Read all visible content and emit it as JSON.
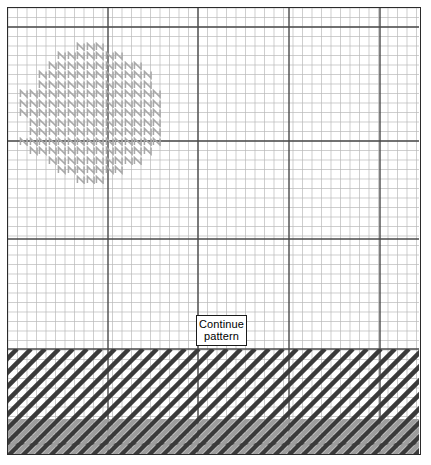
{
  "figure": {
    "kind": "graph-paper-diagram",
    "title_text": "",
    "annotation": {
      "line1": "Continue",
      "line2": "pattern",
      "box": {
        "x": 195,
        "y": 314,
        "w": 51,
        "h": 31
      }
    }
  },
  "colors": {
    "page_background": "#ffffff",
    "paper_background": "#ffffff",
    "border": "#2b2b2b",
    "minor_grid": "#b9b9b9",
    "major_grid": "#4a4a4a",
    "blob_mark": "#a8a8a8",
    "hatch_dark": "#3a3a3a",
    "hatch_light": "#9d9d9d",
    "label_text": "#000000",
    "label_border": "#1a1a1a"
  },
  "grid": {
    "origin_x": 7,
    "origin_y": 7,
    "width": 414,
    "height": 448,
    "minor_step": 9.5,
    "major_every": 5,
    "minor_line_width": 0.7,
    "major_line_width": 1.4,
    "major_x_offsets": [
      0,
      107,
      197,
      288,
      379
    ],
    "major_y_offsets": [
      26,
      140,
      238,
      348,
      443
    ]
  },
  "blob": {
    "label": "hatched-region",
    "cell": 9.5,
    "mark_glyph": "N",
    "rows": [
      {
        "y": 36,
        "x_start": 75,
        "count": 3
      },
      {
        "y": 45.5,
        "x_start": 56,
        "count": 7
      },
      {
        "y": 55,
        "x_start": 46.5,
        "count": 10
      },
      {
        "y": 64.5,
        "x_start": 37,
        "count": 12
      },
      {
        "y": 74,
        "x_start": 37,
        "count": 12
      },
      {
        "y": 83.5,
        "x_start": 18,
        "count": 15
      },
      {
        "y": 93,
        "x_start": 18,
        "count": 15
      },
      {
        "y": 102.5,
        "x_start": 18,
        "count": 15
      },
      {
        "y": 112,
        "x_start": 27.5,
        "count": 14
      },
      {
        "y": 121.5,
        "x_start": 27.5,
        "count": 14
      },
      {
        "y": 131,
        "x_start": 18,
        "count": 15
      },
      {
        "y": 140.5,
        "x_start": 27.5,
        "count": 13
      },
      {
        "y": 150,
        "x_start": 46.5,
        "count": 10
      },
      {
        "y": 159.5,
        "x_start": 56,
        "count": 7
      },
      {
        "y": 169,
        "x_start": 75,
        "count": 3
      }
    ]
  },
  "hatch_band": {
    "label": "diagonal-hatched-band",
    "top": 348,
    "bottom": 455,
    "stroke_spacing": 14,
    "stroke_angle_deg": 45,
    "stroke_width_dark": 4.5,
    "stroke_width_light": 4.5,
    "light_zone_top": 418
  }
}
